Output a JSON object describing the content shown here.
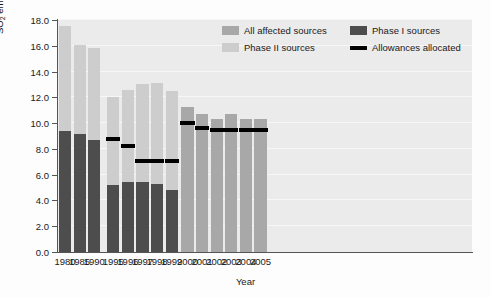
{
  "chart_data": {
    "type": "bar",
    "title": "",
    "xlabel": "Year",
    "ylabel": "SO2 emissions (million tons)",
    "ylabel_parts": {
      "prefix": "SO",
      "sub": "2",
      "suffix": " emissions (million tons)"
    },
    "ylim": [
      0,
      18
    ],
    "ytick_step": 2,
    "ytick_labels": [
      "0.0",
      "2.0",
      "4.0",
      "6.0",
      "8.0",
      "10.0",
      "12.0",
      "14.0",
      "16.0",
      "18.0"
    ],
    "ytick_values": [
      0,
      2,
      4,
      6,
      8,
      10,
      12,
      14,
      16,
      18
    ],
    "grid": true,
    "legend_position": "top-right",
    "categories": [
      "1980",
      "1985",
      "1990",
      "1995",
      "1996",
      "1997",
      "1998",
      "1999",
      "2000",
      "2001",
      "2002",
      "2003",
      "2004",
      "2005"
    ],
    "series": [
      {
        "name": "All affected sources",
        "color": "#a8a8a8",
        "values": [
          null,
          null,
          null,
          null,
          null,
          null,
          null,
          null,
          11.25,
          10.7,
          10.3,
          10.7,
          10.35,
          10.3
        ]
      },
      {
        "name": "Phase II sources",
        "color": "#cdcdcd",
        "values": [
          8.1,
          6.95,
          7.15,
          6.8,
          7.15,
          7.6,
          7.85,
          7.65,
          null,
          null,
          null,
          null,
          null,
          null
        ]
      },
      {
        "name": "Phase I sources",
        "color": "#4d4d4d",
        "values": [
          9.4,
          9.15,
          8.7,
          5.2,
          5.4,
          5.4,
          5.25,
          4.85,
          null,
          null,
          null,
          null,
          null,
          null
        ]
      },
      {
        "name": "Allowances allocated",
        "color": "#000000",
        "marker": "line",
        "values": [
          null,
          null,
          null,
          8.75,
          8.25,
          7.1,
          7.05,
          7.05,
          10.0,
          9.65,
          9.5,
          9.5,
          9.5,
          9.5
        ]
      }
    ],
    "bar_totals": [
      17.5,
      16.1,
      15.85,
      12.0,
      12.55,
      13.0,
      13.1,
      12.5,
      11.25,
      10.7,
      10.3,
      10.7,
      10.35,
      10.3
    ],
    "bars": [
      {
        "category": "1980",
        "phase1": 9.4,
        "phase2": 8.1,
        "total": 17.5,
        "all_affected": null,
        "allowance": null,
        "x_center": 7.0,
        "gap_after": false
      },
      {
        "category": "1985",
        "phase1": 9.15,
        "phase2": 6.95,
        "total": 16.1,
        "all_affected": null,
        "allowance": null,
        "x_center": 21.6,
        "gap_after": false
      },
      {
        "category": "1990",
        "phase1": 8.7,
        "phase2": 7.15,
        "total": 15.85,
        "all_affected": null,
        "allowance": null,
        "x_center": 36.2,
        "gap_after": true
      },
      {
        "category": "1995",
        "phase1": 5.2,
        "phase2": 6.8,
        "total": 12.0,
        "all_affected": null,
        "allowance": 8.75,
        "x_center": 55.3,
        "gap_after": false
      },
      {
        "category": "1996",
        "phase1": 5.4,
        "phase2": 7.15,
        "total": 12.55,
        "all_affected": null,
        "allowance": 8.25,
        "x_center": 69.9,
        "gap_after": false
      },
      {
        "category": "1997",
        "phase1": 5.4,
        "phase2": 7.6,
        "total": 13.0,
        "all_affected": null,
        "allowance": 7.1,
        "x_center": 84.5,
        "gap_after": false
      },
      {
        "category": "1998",
        "phase1": 5.25,
        "phase2": 7.85,
        "total": 13.1,
        "all_affected": null,
        "allowance": 7.05,
        "x_center": 99.1,
        "gap_after": false
      },
      {
        "category": "1999",
        "phase1": 4.85,
        "phase2": 7.65,
        "total": 12.5,
        "all_affected": null,
        "allowance": 7.05,
        "x_center": 113.7,
        "gap_after": false
      },
      {
        "category": "2000",
        "phase1": null,
        "phase2": null,
        "total": 11.25,
        "all_affected": 11.25,
        "allowance": 10.0,
        "x_center": 129.5,
        "gap_after": false
      },
      {
        "category": "2001",
        "phase1": null,
        "phase2": null,
        "total": 10.7,
        "all_affected": 10.7,
        "allowance": 9.65,
        "x_center": 144.1,
        "gap_after": false
      },
      {
        "category": "2002",
        "phase1": null,
        "phase2": null,
        "total": 10.3,
        "all_affected": 10.3,
        "allowance": 9.5,
        "x_center": 158.7,
        "gap_after": false
      },
      {
        "category": "2003",
        "phase1": null,
        "phase2": null,
        "total": 10.7,
        "all_affected": 10.7,
        "allowance": 9.5,
        "x_center": 173.3,
        "gap_after": false
      },
      {
        "category": "2004",
        "phase1": null,
        "phase2": null,
        "total": 10.35,
        "all_affected": 10.35,
        "allowance": 9.5,
        "x_center": 187.9,
        "gap_after": false
      },
      {
        "category": "2005",
        "phase1": null,
        "phase2": null,
        "total": 10.3,
        "all_affected": 10.3,
        "allowance": 9.5,
        "x_center": 202.5,
        "gap_after": false
      }
    ]
  },
  "legend": {
    "entries": [
      {
        "label": "All affected sources",
        "color": "#a8a8a8",
        "kind": "swatch"
      },
      {
        "label": "Phase I sources",
        "color": "#4d4d4d",
        "kind": "swatch"
      },
      {
        "label": "Phase II sources",
        "color": "#cdcdcd",
        "kind": "swatch"
      },
      {
        "label": "Allowances allocated",
        "color": "#000000",
        "kind": "line"
      }
    ]
  },
  "colors": {
    "all_affected": "#a8a8a8",
    "phase1": "#4d4d4d",
    "phase2": "#cdcdcd",
    "allowance": "#000000",
    "plot_background": "#ebebeb",
    "gridline": "#f7f7f7",
    "axis": "#555555"
  }
}
